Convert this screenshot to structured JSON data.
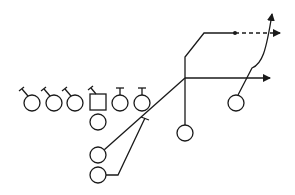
{
  "diagram": {
    "stroke_color": "#1a1a1a",
    "background": "#ffffff",
    "players": [
      {
        "id": "lineman-1",
        "shape": "circle",
        "cx": 32,
        "cy": 103,
        "r": 8,
        "block": "angled"
      },
      {
        "id": "lineman-2",
        "shape": "circle",
        "cx": 54,
        "cy": 103,
        "r": 8,
        "block": "angled"
      },
      {
        "id": "lineman-3",
        "shape": "circle",
        "cx": 75,
        "cy": 103,
        "r": 8,
        "block": "angled"
      },
      {
        "id": "center",
        "shape": "square",
        "cx": 98,
        "cy": 102,
        "size": 16,
        "block": "angled"
      },
      {
        "id": "lineman-5",
        "shape": "circle",
        "cx": 120,
        "cy": 103,
        "r": 8,
        "block": "straight"
      },
      {
        "id": "lineman-6",
        "shape": "circle",
        "cx": 142,
        "cy": 103,
        "r": 8,
        "block": "straight"
      },
      {
        "id": "quarterback",
        "shape": "circle",
        "cx": 98,
        "cy": 122,
        "r": 8
      },
      {
        "id": "back-1",
        "shape": "circle",
        "cx": 98,
        "cy": 155,
        "r": 8
      },
      {
        "id": "back-2",
        "shape": "circle",
        "cx": 98,
        "cy": 175,
        "r": 8
      },
      {
        "id": "slot-receiver",
        "shape": "circle",
        "cx": 185,
        "cy": 133,
        "r": 8
      },
      {
        "id": "wide-receiver",
        "shape": "circle",
        "cx": 236,
        "cy": 103,
        "r": 8
      }
    ],
    "routes": [
      {
        "from": "back-1",
        "type": "arrow",
        "style": "solid"
      },
      {
        "from": "back-2",
        "type": "block",
        "style": "solid"
      },
      {
        "from": "slot-receiver",
        "type": "option",
        "style": "solid-then-dashed"
      },
      {
        "from": "wide-receiver",
        "type": "arrow",
        "style": "solid"
      }
    ]
  }
}
